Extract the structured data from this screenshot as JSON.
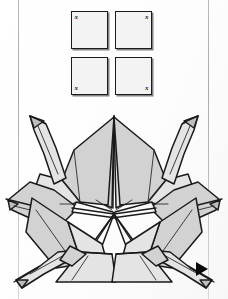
{
  "page": {
    "background_color": "#ffffff",
    "margin_rule_color": "#b9b9b9"
  },
  "squares_panel": {
    "name": "four-squares-diagram",
    "description": "Four square sheets of paper arranged in a 2x2 block, each marked with an x in its outer corner",
    "fill_color": "#f3f3f3",
    "stroke_color": "#1b1b1b",
    "squares": [
      {
        "position": "top-left",
        "mark": "x",
        "mark_corner": "top-left"
      },
      {
        "position": "top-right",
        "mark": "x",
        "mark_corner": "top-right"
      },
      {
        "position": "bottom-left",
        "mark": "x",
        "mark_corner": "bottom-left"
      },
      {
        "position": "bottom-right",
        "mark": "x",
        "mark_corner": "bottom-right"
      }
    ]
  },
  "origami_figure": {
    "name": "crane-ring-assembly",
    "description": "Radially symmetric assembly of folded paper cranes joined at the center",
    "paper_fill": "#d2d2d2",
    "paper_fill_light": "#e6e6e6",
    "paper_fill_white": "#fbfbfb",
    "stroke_color": "#1a1a1a",
    "crane_count": 4,
    "heads": [
      {
        "id": "head-upper-left",
        "direction": "up-left"
      },
      {
        "id": "head-upper-right",
        "direction": "up-right"
      },
      {
        "id": "head-lower-left",
        "direction": "down-left"
      },
      {
        "id": "head-lower-right",
        "direction": "down-right"
      }
    ],
    "points": [
      {
        "id": "point-top",
        "direction": "up"
      },
      {
        "id": "point-left",
        "direction": "left"
      },
      {
        "id": "point-right",
        "direction": "right"
      }
    ]
  },
  "next_arrow": {
    "name": "next-step-arrow",
    "glyph": "▶",
    "color": "#0b0b0b"
  }
}
